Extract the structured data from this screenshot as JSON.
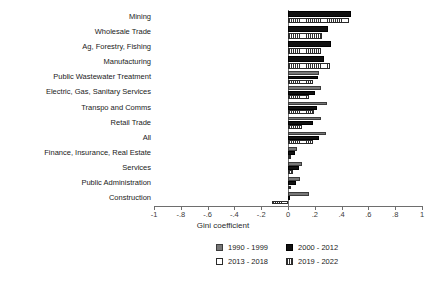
{
  "chart_data": {
    "type": "bar",
    "orientation": "horizontal",
    "title": "",
    "xlabel": "Gini coefficient",
    "ylabel": "",
    "xlim": [
      -1,
      1
    ],
    "grid": false,
    "legend_position": "bottom",
    "xticks": [
      -1,
      -0.8,
      -0.6,
      -0.4,
      -0.2,
      0,
      0.2,
      0.4,
      0.6,
      0.8,
      1
    ],
    "xticklabels": [
      "-1",
      "-.8",
      "-.6",
      "-.4",
      "-.2",
      "0",
      ".2",
      ".4",
      ".6",
      ".8",
      "1"
    ],
    "categories": [
      "Mining",
      "Wholesale Trade",
      "Ag, Forestry, Fishing",
      "Manufacturing",
      "Public Wastewater Treatment",
      "Electric, Gas, Sanitary Services",
      "Transpo and Comms",
      "Retail Trade",
      "All",
      "Finance, Insurance, Real Estate",
      "Services",
      "Public Administration",
      "Construction"
    ],
    "series": [
      {
        "name": "1990 - 1999",
        "color": "#777777",
        "style": "solid-gray",
        "values": [
          null,
          null,
          null,
          null,
          0.235,
          0.245,
          0.29,
          0.245,
          0.28,
          0.065,
          0.105,
          0.09,
          0.155
        ]
      },
      {
        "name": "2000 - 2012",
        "color": "#111111",
        "style": "solid-black",
        "values": [
          0.47,
          0.295,
          0.32,
          0.265,
          0.225,
          0.205,
          0.22,
          0.185,
          0.23,
          0.05,
          0.085,
          0.06,
          0.01
        ]
      },
      {
        "name": "2013 - 2018",
        "color": "#ffffff",
        "style": "hollow",
        "values": [
          null,
          null,
          null,
          null,
          null,
          null,
          null,
          null,
          null,
          null,
          null,
          null,
          null
        ]
      },
      {
        "name": "2019 - 2022",
        "color": "#ffffff",
        "style": "hatched",
        "values": [
          0.455,
          0.255,
          0.245,
          0.315,
          0.19,
          0.155,
          0.195,
          0.105,
          0.185,
          0.02,
          0.04,
          0.025,
          -0.12
        ]
      }
    ]
  },
  "legend": {
    "items": [
      {
        "label": "1990 - 1999",
        "style": "s1990"
      },
      {
        "label": "2000 - 2012",
        "style": "s2000"
      },
      {
        "label": "2013 - 2018",
        "style": "s2013"
      },
      {
        "label": "2019 - 2022",
        "style": "s2019"
      }
    ]
  }
}
